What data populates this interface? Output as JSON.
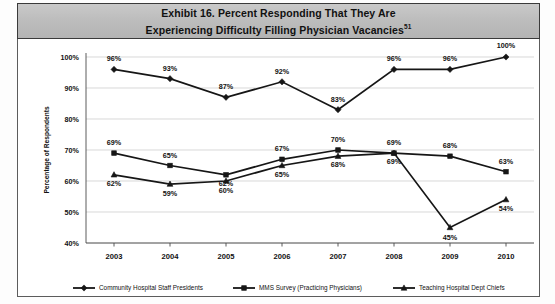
{
  "exhibit": {
    "title_line1": "Exhibit 16. Percent Responding That They Are",
    "title_line2": "Experiencing Difficulty Filling Physician Vacancies",
    "title_superscript": "51"
  },
  "chart_data": {
    "type": "line",
    "title": "Exhibit 16. Percent Responding That They Are Experiencing Difficulty Filling Physician Vacancies",
    "xlabel": "",
    "ylabel": "Percentage of Respondents",
    "categories": [
      "2003",
      "2004",
      "2005",
      "2006",
      "2007",
      "2008",
      "2009",
      "2010"
    ],
    "ylim": [
      40,
      100
    ],
    "yticks": [
      "40%",
      "50%",
      "60%",
      "70%",
      "80%",
      "90%",
      "100%"
    ],
    "ytick_values": [
      40,
      50,
      60,
      70,
      80,
      90,
      100
    ],
    "grid": true,
    "legend_position": "bottom",
    "series": [
      {
        "name": "Community Hospital Staff Presidents",
        "marker": "diamond",
        "color": "#161616",
        "values": [
          96,
          93,
          87,
          92,
          83,
          96,
          96,
          100
        ],
        "labels": [
          "96%",
          "93%",
          "87%",
          "92%",
          "83%",
          "96%",
          "96%",
          "100%"
        ]
      },
      {
        "name": "MMS Survey (Practicing Physicians)",
        "marker": "square",
        "color": "#161616",
        "values": [
          69,
          65,
          62,
          67,
          70,
          69,
          68,
          63
        ],
        "labels": [
          "69%",
          "65%",
          "62%",
          "67%",
          "70%",
          "69%",
          "68%",
          "63%"
        ]
      },
      {
        "name": "Teaching Hospital Dept Chiefs",
        "marker": "triangle",
        "color": "#161616",
        "values": [
          62,
          59,
          60,
          65,
          68,
          69,
          45,
          54
        ],
        "labels": [
          "62%",
          "59%",
          "60%",
          "65%",
          "68%",
          "69%",
          "45%",
          "54%"
        ]
      }
    ]
  }
}
